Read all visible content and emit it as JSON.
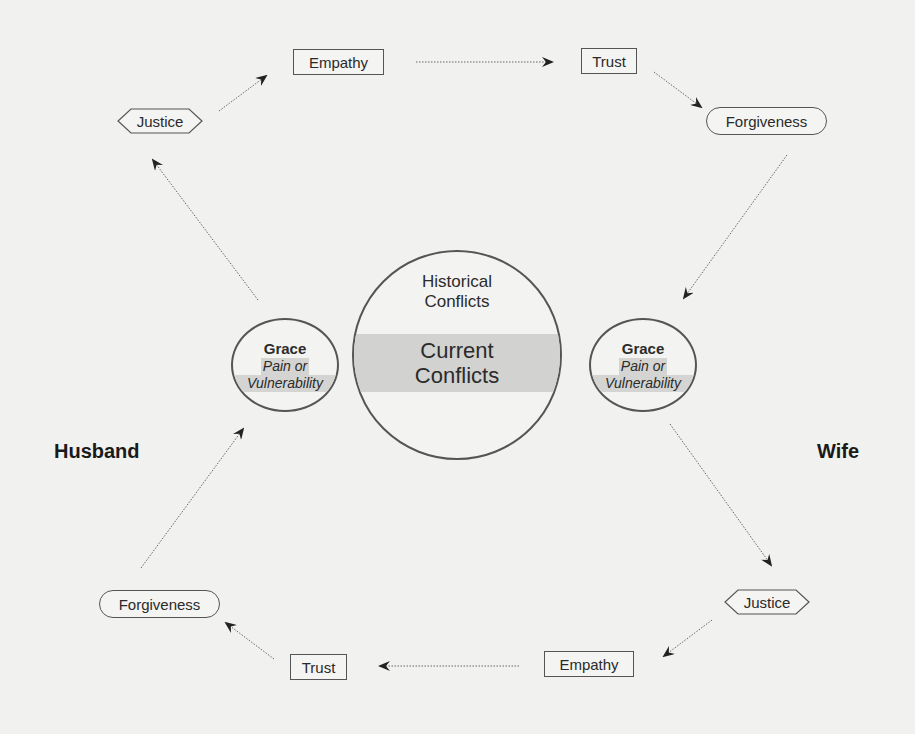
{
  "diagram": {
    "center": {
      "historical": [
        "Historical",
        "Conflicts"
      ],
      "current": [
        "Current",
        "Conflicts"
      ]
    },
    "husband": {
      "label": "Husband",
      "grace": {
        "title": "Grace",
        "line1": "Pain or",
        "line2": "Vulnerability"
      },
      "cycle": {
        "justice": "Justice",
        "empathy": "Empathy",
        "trust": "Trust",
        "forgiveness": "Forgiveness"
      }
    },
    "wife": {
      "label": "Wife",
      "grace": {
        "title": "Grace",
        "line1": "Pain or",
        "line2": "Vulnerability"
      },
      "cycle": {
        "forgiveness": "Forgiveness",
        "justice": "Justice",
        "empathy": "Empathy",
        "trust": "Trust"
      }
    },
    "top_row": {
      "empathy": "Empathy",
      "trust": "Trust",
      "forgiveness": "Forgiveness",
      "justice": "Justice"
    },
    "bottom_row": {
      "justice": "Justice",
      "empathy": "Empathy",
      "trust": "Trust",
      "forgiveness": "Forgiveness"
    }
  }
}
